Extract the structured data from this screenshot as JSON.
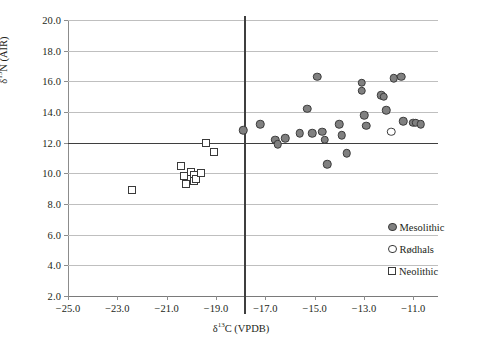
{
  "chart_data": {
    "type": "scatter",
    "title": "",
    "xlabel_html": "δ<sup>13</sup>C (VPDB)",
    "ylabel_html": "δ<sup>15</sup>N (AIR)",
    "xlim": [
      -25.0,
      -10.0
    ],
    "ylim": [
      2.0,
      20.0
    ],
    "xticks": [
      -25.0,
      -23.0,
      -21.0,
      -19.0,
      -17.0,
      -15.0,
      -13.0,
      -11.0
    ],
    "xtick_labels": [
      "-25.0",
      "-23.0",
      "-21.0",
      "-19.0",
      "-17.0",
      "-15.0",
      "-13.0",
      "-11.0"
    ],
    "yticks": [
      2.0,
      4.0,
      6.0,
      8.0,
      10.0,
      12.0,
      14.0,
      16.0,
      18.0,
      20.0
    ],
    "ytick_labels": [
      "2.0",
      "4.0",
      "6.0",
      "8.0",
      "10.0",
      "12.0",
      "14.0",
      "16.0",
      "18.0",
      "20.0"
    ],
    "grid": "horizontal",
    "reference_lines": [
      {
        "orientation": "horizontal",
        "value": 12.0,
        "name": "n15-threshold-line"
      },
      {
        "orientation": "vertical",
        "value": -17.85,
        "name": "c13-threshold-line"
      }
    ],
    "legend_position": "bottom-right",
    "series": [
      {
        "name": "Mesolithic",
        "marker": "filled-circle",
        "color": "#808080",
        "edge_color": "#3a3a3a",
        "points": [
          [
            -17.9,
            12.8
          ],
          [
            -17.2,
            13.2
          ],
          [
            -16.6,
            12.2
          ],
          [
            -16.5,
            11.9
          ],
          [
            -16.2,
            12.3
          ],
          [
            -15.6,
            12.6
          ],
          [
            -15.3,
            14.2
          ],
          [
            -15.1,
            12.6
          ],
          [
            -14.9,
            16.3
          ],
          [
            -14.7,
            12.7
          ],
          [
            -14.6,
            12.2
          ],
          [
            -14.5,
            10.6
          ],
          [
            -14.0,
            13.2
          ],
          [
            -13.9,
            12.5
          ],
          [
            -13.7,
            11.3
          ],
          [
            -13.1,
            15.9
          ],
          [
            -13.1,
            15.4
          ],
          [
            -13.0,
            13.8
          ],
          [
            -12.9,
            13.1
          ],
          [
            -12.3,
            15.1
          ],
          [
            -12.2,
            15.0
          ],
          [
            -12.1,
            14.1
          ],
          [
            -11.8,
            16.2
          ],
          [
            -11.5,
            16.3
          ],
          [
            -11.4,
            13.4
          ],
          [
            -11.0,
            13.3
          ],
          [
            -10.9,
            13.3
          ],
          [
            -10.7,
            13.2
          ]
        ]
      },
      {
        "name": "Rødhals",
        "marker": "open-circle",
        "color": "#ffffff",
        "edge_color": "#3a3a3a",
        "points": [
          [
            -11.9,
            12.7
          ]
        ]
      },
      {
        "name": "Neolithic",
        "marker": "open-square",
        "color": "#ffffff",
        "edge_color": "#3a3a3a",
        "points": [
          [
            -22.4,
            8.9
          ],
          [
            -20.4,
            10.5
          ],
          [
            -20.3,
            9.8
          ],
          [
            -20.2,
            9.3
          ],
          [
            -20.0,
            10.1
          ],
          [
            -19.9,
            9.9
          ],
          [
            -19.9,
            9.5
          ],
          [
            -19.8,
            9.6
          ],
          [
            -19.6,
            10.0
          ],
          [
            -19.4,
            12.0
          ],
          [
            -19.1,
            11.4
          ]
        ]
      }
    ]
  },
  "legend": {
    "entries": [
      {
        "label": "Mesolithic",
        "marker": "filled-circle"
      },
      {
        "label": "Rødhals",
        "marker": "open-circle"
      },
      {
        "label": "Neolithic",
        "marker": "open-square"
      }
    ]
  }
}
